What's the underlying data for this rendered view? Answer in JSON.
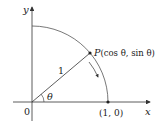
{
  "figure": {
    "axis_labels": {
      "x": "x",
      "y": "y"
    },
    "origin_label": "0",
    "radius_label": "1",
    "angle_label": "θ",
    "point_P": {
      "name": "P",
      "coords_text": "(cos θ, sin θ)"
    },
    "point_on_x_axis": "(1, 0)",
    "colors": {
      "axes": "#333333",
      "arc": "#555555",
      "radius": "#333333",
      "points": "#222222"
    }
  }
}
